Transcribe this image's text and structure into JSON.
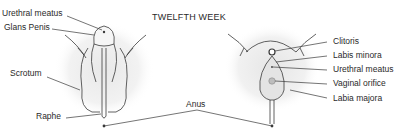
{
  "title": "TWELFTH WEEK",
  "male": {
    "labels": {
      "urethral_meatus": "Urethral meatus",
      "glans_penis": "Glans Penis",
      "scrotum": "Scrotum",
      "raphe": "Raphe"
    }
  },
  "shared": {
    "anus": "Anus"
  },
  "female": {
    "labels": {
      "clitoris": "Clitoris",
      "labia_minora": "Labis minora",
      "urethral_meatus": "Urethral meatus",
      "vaginal_orifice": "Vaginal orifice",
      "labia_majora": "Labia majora"
    }
  },
  "colors": {
    "line": "#3a3a3a",
    "shade": "#ececec",
    "text": "#2a2a2a"
  }
}
